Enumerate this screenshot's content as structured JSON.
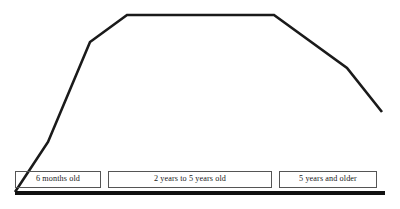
{
  "chart_data": {
    "type": "line",
    "title": "",
    "subtitle": "",
    "xlabel": "",
    "ylabel": "",
    "grid": false,
    "legend_position": "none",
    "xlim": [
      0,
      400
    ],
    "ylim": [
      0,
      209
    ],
    "annotations": [],
    "series": [
      {
        "name": "curve",
        "color": "#1a1a1a",
        "points": [
          {
            "x": 15,
            "y": 192
          },
          {
            "x": 48,
            "y": 142
          },
          {
            "x": 90,
            "y": 42
          },
          {
            "x": 127,
            "y": 15
          },
          {
            "x": 274,
            "y": 15
          },
          {
            "x": 347,
            "y": 68
          },
          {
            "x": 382,
            "y": 112
          }
        ]
      }
    ],
    "categories": [
      "6 months old",
      "2 years to 5 years old",
      "5 years and older"
    ],
    "stage_boxes": [
      {
        "label": "6 months old"
      },
      {
        "label": "2 years to 5 years old"
      },
      {
        "label": "5 years and older"
      }
    ],
    "baseline": {
      "color": "#111111"
    }
  },
  "colors": {
    "curve": "#1a1a1a",
    "baseline": "#111111",
    "box_border": "#555555",
    "background": "#ffffff"
  }
}
